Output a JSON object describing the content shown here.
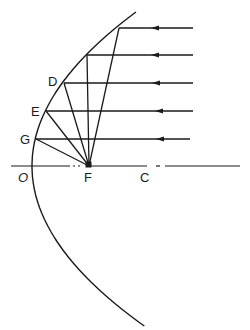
{
  "diagram": {
    "labels": {
      "D": "D",
      "E": "E",
      "G": "G",
      "O": "O",
      "F": "F",
      "C": "C"
    },
    "vertex": {
      "x": 32,
      "y": 166
    },
    "focus": {
      "x": 89,
      "y": 166
    },
    "center_of_curvature": {
      "x": 145,
      "y": 166
    },
    "incoming_rays_y": [
      28,
      55,
      83,
      111,
      139
    ],
    "ray_start_x": 193,
    "line_color": "#1a1a1a",
    "background": "#ffffff"
  }
}
